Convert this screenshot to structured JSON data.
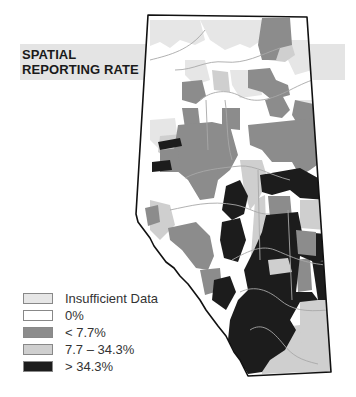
{
  "title": {
    "line1": "SPATIAL",
    "line2": "REPORTING RATE"
  },
  "legend": {
    "items": [
      {
        "label": "Insufficient Data",
        "color": "#e6e6e6"
      },
      {
        "label": "0%",
        "color": "#ffffff"
      },
      {
        "label": "< 7.7%",
        "color": "#8c8c8c"
      },
      {
        "label": "7.7 – 34.3%",
        "color": "#cfcfcf"
      },
      {
        "label": "> 34.3%",
        "color": "#1c1c1c"
      }
    ]
  },
  "map": {
    "region": "Alberta",
    "classes": {
      "insufficient": "#e6e6e6",
      "zero": "#ffffff",
      "low": "#8c8c8c",
      "mid": "#cfcfcf",
      "high": "#1c1c1c"
    },
    "outline_color": "#111111",
    "river_color": "#a8a8a8"
  }
}
